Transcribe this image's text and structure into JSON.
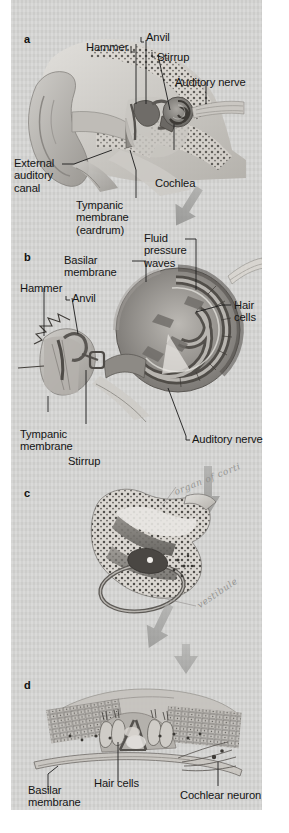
{
  "figure": {
    "background_color": "#d3d3d1",
    "label_color": "#141414",
    "arrow_color": "#9a9a98",
    "panel_count": 4
  },
  "panels": [
    {
      "letter": "a",
      "name": "whole-ear-cross-section",
      "labels": [
        {
          "text": "Hammer",
          "name": "label-hammer-a"
        },
        {
          "text": "Anvil",
          "name": "label-anvil-a"
        },
        {
          "text": "Stirrup",
          "name": "label-stirrup-a"
        },
        {
          "text": "Auditory nerve",
          "name": "label-auditory-nerve-a"
        },
        {
          "text": "External\nauditory\ncanal",
          "name": "label-external-auditory-canal"
        },
        {
          "text": "Cochlea",
          "name": "label-cochlea"
        },
        {
          "text": "Tympanic\nmembrane\n(eardrum)",
          "name": "label-tympanic-membrane-a"
        }
      ]
    },
    {
      "letter": "b",
      "name": "uncoiled-cochlea",
      "labels": [
        {
          "text": "Basilar\nmembrane",
          "name": "label-basilar-membrane-b"
        },
        {
          "text": "Fluid\npressure\nwaves",
          "name": "label-fluid-pressure-waves"
        },
        {
          "text": "Hammer",
          "name": "label-hammer-b"
        },
        {
          "text": "Anvil",
          "name": "label-anvil-b"
        },
        {
          "text": "Hair\ncells",
          "name": "label-hair-cells-b"
        },
        {
          "text": "Tympanic\nmembrane",
          "name": "label-tympanic-membrane-b"
        },
        {
          "text": "Stirrup",
          "name": "label-stirrup-b"
        },
        {
          "text": "Auditory nerve",
          "name": "label-auditory-nerve-b"
        }
      ]
    },
    {
      "letter": "c",
      "name": "cochlea-cross-section",
      "labels": [],
      "annotations": [
        {
          "text": "organ of corti",
          "name": "handwritten-annotation-upper"
        },
        {
          "text": "vestibule",
          "name": "handwritten-annotation-vestibule"
        }
      ]
    },
    {
      "letter": "d",
      "name": "organ-of-corti-detail",
      "labels": [
        {
          "text": "Basilar\nmembrane",
          "name": "label-basilar-membrane-d"
        },
        {
          "text": "Hair cells",
          "name": "label-hair-cells-d"
        },
        {
          "text": "Cochlear neuron",
          "name": "label-cochlear-neuron"
        }
      ]
    }
  ],
  "arrows": [
    {
      "name": "arrow-a-to-b",
      "direction": "down-right"
    },
    {
      "name": "arrow-b-to-c",
      "direction": "down"
    },
    {
      "name": "arrow-c-to-d",
      "direction": "down-right"
    },
    {
      "name": "arrow-into-d",
      "direction": "down"
    }
  ]
}
